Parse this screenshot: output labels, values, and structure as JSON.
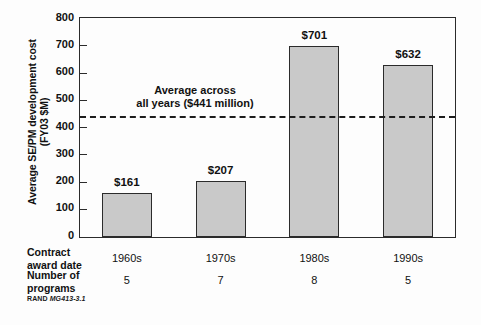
{
  "chart_data": {
    "type": "bar",
    "title": "",
    "xlabel": "Contract award date",
    "ylabel": "Average SE/PM development cost (FY03 $M)",
    "ylabel_line1": "Average SE/PM development cost",
    "ylabel_line2": "(FY03 $M)",
    "categories": [
      "1960s",
      "1970s",
      "1980s",
      "1990s"
    ],
    "values": [
      161,
      207,
      701,
      632
    ],
    "value_labels": [
      "$161",
      "$207",
      "$701",
      "$632"
    ],
    "ylim": [
      0,
      800
    ],
    "yticks": [
      0,
      100,
      200,
      300,
      400,
      500,
      600,
      700,
      800
    ],
    "ytick_labels": [
      "0",
      "100",
      "200",
      "300",
      "400",
      "500",
      "600",
      "700",
      "800"
    ],
    "grid": false,
    "legend": "none",
    "bar_color": "#c9c9c9",
    "bar_edge_color": "#2b2b2b",
    "annotations": [
      {
        "name": "average-line",
        "value": 441,
        "line1": "Average across",
        "line2": "all years ($441 million)",
        "style": "dashed",
        "color": "#1d1d1d"
      }
    ],
    "secondary_rows": [
      {
        "label_line1": "Number of",
        "label_line2": "programs",
        "values": [
          "5",
          "7",
          "8",
          "5"
        ]
      }
    ]
  },
  "axis": {
    "y_title_line1": "Average SE/PM development cost",
    "y_title_line2": "(FY03 $M)",
    "y_ticks": [
      "800",
      "700",
      "600",
      "500",
      "400",
      "300",
      "200",
      "100",
      "0"
    ]
  },
  "bars": [
    {
      "category": "1960s",
      "value": 161,
      "label": "$161",
      "programs": "5"
    },
    {
      "category": "1970s",
      "value": 207,
      "label": "$207",
      "programs": "7"
    },
    {
      "category": "1980s",
      "value": 701,
      "label": "$701",
      "programs": "8"
    },
    {
      "category": "1990s",
      "value": 632,
      "label": "$632",
      "programs": "5"
    }
  ],
  "average": {
    "value": 441,
    "line1": "Average across",
    "line2": "all years ($441 million)"
  },
  "table": {
    "row1_label_line1": "Contract",
    "row1_label_line2": "award date",
    "row2_label_line1": "Number of",
    "row2_label_line2": "programs"
  },
  "source": {
    "org": "RAND",
    "figure_id": "MG413-3.1"
  }
}
